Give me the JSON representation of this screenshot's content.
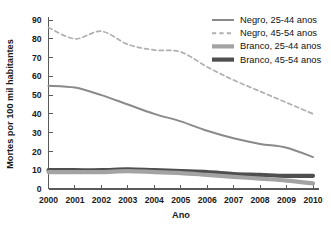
{
  "chart_data": {
    "type": "line",
    "title": "",
    "xlabel": "Ano",
    "ylabel": "Mortes por 100 mil habitantes",
    "x": [
      2000,
      2001,
      2002,
      2003,
      2004,
      2005,
      2006,
      2007,
      2008,
      2009,
      2010
    ],
    "categories": [
      "2000",
      "2001",
      "2002",
      "2003",
      "2004",
      "2005",
      "2006",
      "2007",
      "2008",
      "2009",
      "2010"
    ],
    "xlim": [
      2000,
      2010
    ],
    "ylim": [
      0,
      90
    ],
    "yticks": [
      0,
      10,
      20,
      30,
      40,
      50,
      60,
      70,
      80,
      90
    ],
    "ytick_labels": [
      "0",
      "10",
      "20",
      "30",
      "40",
      "50",
      "60",
      "70",
      "80",
      "90"
    ],
    "grid": false,
    "legend_position": "top-right",
    "series": [
      {
        "name": "Negro, 25-44 anos",
        "values": [
          55,
          54,
          50,
          45,
          40,
          36,
          31,
          27,
          24,
          22,
          17
        ],
        "color": "#8a8a8a",
        "style": "solid",
        "width": 2.0
      },
      {
        "name": "Negro, 45-54 anos",
        "values": [
          86,
          80,
          84,
          77,
          74,
          73,
          65,
          58,
          52,
          46,
          40
        ],
        "color": "#b0b0b0",
        "style": "dashed",
        "width": 1.7
      },
      {
        "name": "Branco, 25-44 anos",
        "values": [
          9,
          9,
          9,
          9.5,
          9,
          8.5,
          7.5,
          6.5,
          5.5,
          4.5,
          3
        ],
        "color": "#a3a3a3",
        "style": "solid",
        "width": 4.2
      },
      {
        "name": "Branco, 45-54 anos",
        "values": [
          10,
          10,
          10,
          10.5,
          10,
          9.5,
          9,
          8,
          7.5,
          7,
          7
        ],
        "color": "#4f4f4f",
        "style": "solid",
        "width": 4.2
      }
    ]
  },
  "legend": {
    "items": [
      {
        "label": "Negro, 25-44 anos"
      },
      {
        "label": "Negro, 45-54 anos"
      },
      {
        "label": "Branco, 25-44 anos"
      },
      {
        "label": "Branco, 45-54 anos"
      }
    ]
  },
  "axes": {
    "x_title": "Ano",
    "y_title": "Mortes por 100 mil habitantes"
  }
}
